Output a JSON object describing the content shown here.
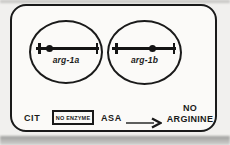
{
  "figure": {
    "plates": [
      {
        "label": "arg-1a",
        "locus_position": "left"
      },
      {
        "label": "arg-1b",
        "locus_position": "right"
      }
    ],
    "pathway": {
      "cit": "CIT",
      "enzyme_box": "NO ENZYME",
      "asa": "ASA",
      "product_line1": "NO",
      "product_line2": "ARGININE"
    },
    "icons": {
      "arrow": "arrow-right-icon"
    },
    "colors": {
      "ink": "#1a1a1a",
      "paper": "#fbfaf8",
      "page_background": "#f1f0ee",
      "scan_shadow": "#9e9e9c"
    }
  }
}
